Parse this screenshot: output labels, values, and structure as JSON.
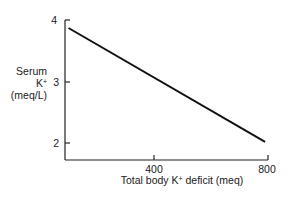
{
  "chart_data": {
    "type": "line",
    "title": "",
    "xlabel": "Total body K+ deficit (meq)",
    "ylabel": "Serum K+ (meq/L)",
    "ylabel_lines": [
      "Serum",
      "K+",
      "(meq/L)"
    ],
    "x_ticks": [
      400,
      800
    ],
    "y_ticks": [
      2,
      3,
      4
    ],
    "xlim": [
      90,
      800
    ],
    "ylim": [
      1.7,
      4
    ],
    "grid": false,
    "legend": null,
    "series": [
      {
        "name": "Serum K+ vs total body K+ deficit",
        "color": "#111111",
        "x": [
          100,
          790
        ],
        "y": [
          3.87,
          2.02
        ]
      }
    ]
  }
}
